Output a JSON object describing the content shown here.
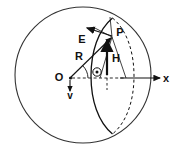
{
  "figure": {
    "background_color": "#ffffff",
    "stroke_color": "#111111",
    "width": 173,
    "height": 151
  },
  "labels": {
    "origin": "O",
    "point_p": "P",
    "radius": "R",
    "efield": "E",
    "hfield": "H",
    "velocity": "v",
    "angle": "Θ",
    "axis_x": "x"
  },
  "shapes": {
    "sphere": {
      "name": "outer-sphere-circle",
      "cx": 83,
      "cy": 75,
      "r": 68,
      "dashed": false
    },
    "equator_ellipse": {
      "name": "perspective-circle",
      "cx": 113,
      "cy": 76,
      "rx": 22,
      "ry": 58,
      "front_solid": true,
      "back_dashed": true
    }
  },
  "vectors": [
    {
      "name": "radius-vector-R",
      "label": "R",
      "from": [
        70,
        78
      ],
      "to": [
        112,
        37
      ],
      "style": "solid-arrow"
    },
    {
      "name": "efield-vector-E",
      "label": "E",
      "from": [
        112,
        37
      ],
      "to": [
        88,
        29
      ],
      "style": "solid-arrow"
    },
    {
      "name": "hfield-vector-H",
      "label": "H",
      "from": [
        107,
        74
      ],
      "to": [
        107,
        40
      ],
      "style": "thick-arrow"
    },
    {
      "name": "velocity-vector-v",
      "label": "v",
      "from": [
        70,
        80
      ],
      "to": [
        70,
        93
      ],
      "style": "solid-arrow"
    },
    {
      "name": "x-axis",
      "label": "x",
      "from": [
        70,
        78
      ],
      "to": [
        162,
        78
      ],
      "style": "solid-arrow-dashed-tail"
    }
  ],
  "annotations": {
    "angle_marker": "Θ",
    "angle_at": "origin",
    "dashed_baseline": "x-axis projection from O to ellipse center"
  }
}
